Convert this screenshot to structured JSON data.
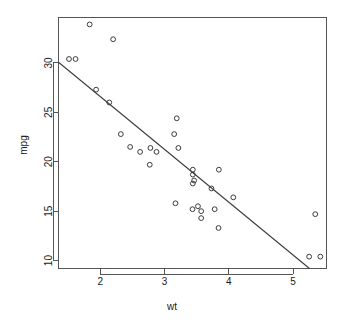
{
  "chart_data": {
    "type": "scatter",
    "title": "",
    "subtitle": "",
    "xlabel": "wt",
    "ylabel": "mpg",
    "xlim": [
      1.35,
      5.52
    ],
    "ylim": [
      9.2,
      34.6
    ],
    "xticks": [
      2,
      3,
      4,
      5
    ],
    "xtick_labels": [
      "2",
      "3",
      "4",
      "5"
    ],
    "yticks": [
      10,
      15,
      20,
      25,
      30
    ],
    "ytick_labels": [
      "10",
      "15",
      "20",
      "25",
      "30"
    ],
    "grid": false,
    "legend": false,
    "legend_position": "none",
    "point_symbol": "open-circle",
    "point_radius": 2.4,
    "series": [
      {
        "name": "mtcars",
        "x": [
          2.62,
          2.875,
          2.32,
          3.215,
          3.44,
          3.46,
          3.57,
          3.19,
          3.15,
          3.44,
          3.44,
          4.07,
          3.73,
          3.78,
          5.25,
          5.424,
          5.345,
          2.2,
          1.615,
          1.835,
          2.465,
          3.52,
          3.435,
          3.84,
          3.845,
          1.935,
          2.14,
          1.513,
          3.17,
          2.77,
          3.57,
          2.78
        ],
        "y": [
          21.0,
          21.0,
          22.8,
          21.4,
          18.7,
          18.1,
          14.3,
          24.4,
          22.8,
          19.2,
          17.8,
          16.4,
          17.3,
          15.2,
          10.4,
          10.4,
          14.7,
          32.4,
          30.4,
          33.9,
          21.5,
          15.5,
          15.2,
          13.3,
          19.2,
          27.3,
          26.0,
          30.4,
          15.8,
          19.7,
          15.0,
          21.4
        ]
      }
    ],
    "fit_line": {
      "type": "linear-regression",
      "intercept": 37.285,
      "slope": -5.344,
      "visible": true
    }
  },
  "axes": {
    "x_title": "wt",
    "y_title": "mpg"
  }
}
